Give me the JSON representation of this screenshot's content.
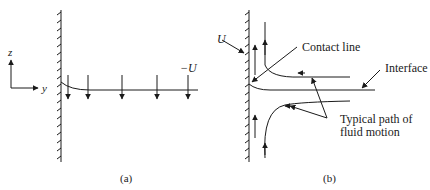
{
  "panel_a": {
    "caption": "(a)",
    "axis_z": "z",
    "axis_y": "y",
    "velocity_label": "−U"
  },
  "panel_b": {
    "caption": "(b)",
    "wall_velocity_label": "U",
    "contact_line_label": "Contact line",
    "interface_label": "Interface",
    "path_label_line1": "Typical path of",
    "path_label_line2": "fluid motion"
  },
  "colors": {
    "ink": "#1a1a1a",
    "background": "#ffffff"
  }
}
